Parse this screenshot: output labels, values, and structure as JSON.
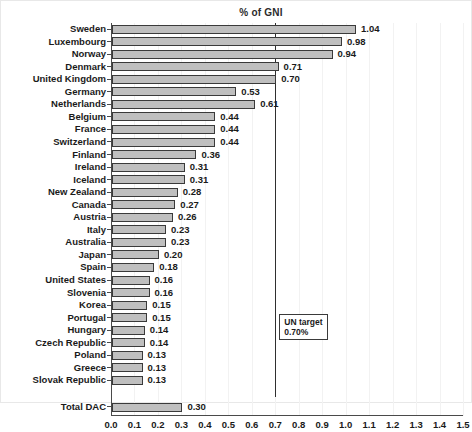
{
  "chart_data": {
    "type": "bar",
    "orientation": "horizontal",
    "title": "% of GNI",
    "xlabel": "",
    "ylabel": "",
    "xlim": [
      0.0,
      1.5
    ],
    "xticks": [
      "0.0",
      "0.1",
      "0.2",
      "0.3",
      "0.4",
      "0.5",
      "0.6",
      "0.7",
      "0.8",
      "0.9",
      "1.0",
      "1.1",
      "1.2",
      "1.3",
      "1.4",
      "1.5"
    ],
    "xtick_values": [
      0.0,
      0.1,
      0.2,
      0.3,
      0.4,
      0.5,
      0.6,
      0.7,
      0.8,
      0.9,
      1.0,
      1.1,
      1.2,
      1.3,
      1.4,
      1.5
    ],
    "grid": "vertical-light",
    "legend": "none",
    "categories": [
      "Sweden",
      "Luxembourg",
      "Norway",
      "Denmark",
      "United Kingdom",
      "Germany",
      "Netherlands",
      "Belgium",
      "France",
      "Switzerland",
      "Finland",
      "Ireland",
      "Iceland",
      "New Zealand",
      "Canada",
      "Austria",
      "Italy",
      "Australia",
      "Japan",
      "Spain",
      "United States",
      "Slovenia",
      "Korea",
      "Portugal",
      "Hungary",
      "Czech Republic",
      "Poland",
      "Greece",
      "Slovak Republic"
    ],
    "values": [
      1.04,
      0.98,
      0.94,
      0.71,
      0.7,
      0.53,
      0.61,
      0.44,
      0.44,
      0.44,
      0.36,
      0.31,
      0.31,
      0.28,
      0.27,
      0.26,
      0.23,
      0.23,
      0.2,
      0.18,
      0.16,
      0.16,
      0.15,
      0.15,
      0.14,
      0.14,
      0.13,
      0.13,
      0.13
    ],
    "data_labels": [
      "1.04",
      "0.98",
      "0.94",
      "0.71",
      "0.70",
      "0.53",
      "0.61",
      "0.44",
      "0.44",
      "0.44",
      "0.36",
      "0.31",
      "0.31",
      "0.28",
      "0.27",
      "0.26",
      "0.23",
      "0.23",
      "0.20",
      "0.18",
      "0.16",
      "0.16",
      "0.15",
      "0.15",
      "0.14",
      "0.14",
      "0.13",
      "0.13",
      "0.13"
    ],
    "summary_row": {
      "category": "Total DAC",
      "value": 0.3,
      "data_label": "0.30"
    },
    "annotations": [
      {
        "name": "UN target",
        "line_1": "UN target",
        "line_2": "0.70%",
        "x_value": 0.7
      }
    ],
    "colors": {
      "bar_fill": "#bfbfbf",
      "bar_stroke": "#3a3a3a",
      "axis": "#4a4a4a",
      "target_line": "#2f2f2f",
      "grid": "#f2f2f2",
      "text": "#1a1a1a",
      "background": "#ffffff"
    }
  }
}
